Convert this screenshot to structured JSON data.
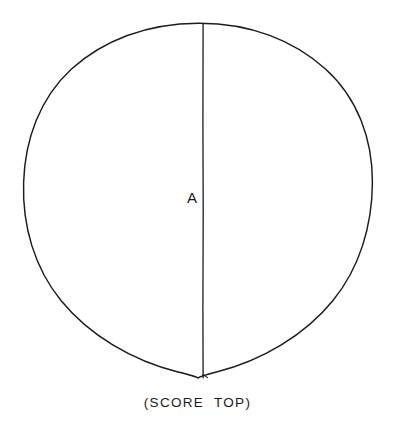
{
  "drawing": {
    "kind": "technical-line-drawing",
    "background_color": "#ffffff",
    "ink_color": "#1b1c1e",
    "stroke_width": 1.4,
    "shape": {
      "name": "circle-outline",
      "center_x": 198,
      "center_y": 200,
      "radius_x": 174,
      "radius_y": 177
    },
    "score_line": {
      "name": "vertical-score-line",
      "x": 203,
      "y_top": 23,
      "y_bottom": 378
    },
    "labels": {
      "score_line_label": "A"
    },
    "caption": "(SCORE  TOP)"
  }
}
